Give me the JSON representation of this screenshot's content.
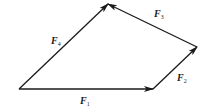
{
  "diagram": {
    "type": "vector-polygon",
    "stroke_color": "#1a1a1a",
    "background": "#ffffff",
    "points": {
      "O": [
        19,
        89
      ],
      "A": [
        153,
        89
      ],
      "B": [
        197,
        47
      ],
      "C": [
        108,
        4
      ]
    },
    "vectors": [
      {
        "id": "F1",
        "from": "O",
        "to": "A",
        "symbol": "F",
        "subscript": "1",
        "label_pos": [
          80,
          96
        ]
      },
      {
        "id": "F2",
        "from": "A",
        "to": "B",
        "symbol": "F",
        "subscript": "2",
        "label_pos": [
          177,
          73
        ]
      },
      {
        "id": "F3",
        "from": "B",
        "to": "C",
        "symbol": "F",
        "subscript": "3",
        "label_pos": [
          154,
          9
        ]
      },
      {
        "id": "F4",
        "from": "O",
        "to": "C",
        "symbol": "F",
        "subscript": "4",
        "label_pos": [
          51,
          36
        ]
      }
    ]
  },
  "labels": {
    "f1": {
      "symbol": "F",
      "sub": "1"
    },
    "f2": {
      "symbol": "F",
      "sub": "2"
    },
    "f3": {
      "symbol": "F",
      "sub": "3"
    },
    "f4": {
      "symbol": "F",
      "sub": "4"
    }
  }
}
